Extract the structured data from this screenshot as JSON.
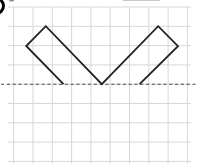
{
  "figure": {
    "canvas": {
      "width": 197,
      "height": 164,
      "background": "#ffffff"
    },
    "grid": {
      "color": "#d7d7d7",
      "stroke_width": 1,
      "spacing": 19.3,
      "vertical": {
        "start_x": 13.7,
        "count": 10,
        "y1": 7,
        "y2": 164
      },
      "horizontal": {
        "start_y": 7,
        "count": 9,
        "x1": 8,
        "x2": 191
      }
    },
    "mirror_line": {
      "y": 84.2,
      "x1": 1,
      "x2": 196,
      "color": "#4d4d4d",
      "stroke_width": 1.1,
      "dash": "3.2,2.6"
    },
    "shape": {
      "type": "open-polyline",
      "color": "#222222",
      "stroke_width": 1.8,
      "points": [
        [
          63.5,
          84.2
        ],
        [
          26.2,
          46.0
        ],
        [
          45.8,
          26.2
        ],
        [
          101.8,
          84.2
        ],
        [
          158.2,
          26.2
        ],
        [
          178.0,
          46.2
        ],
        [
          139.6,
          84.2
        ]
      ]
    },
    "label_badge": {
      "shape": "partial-circle-cut-at-left-edge",
      "cx": -4,
      "cy": 6,
      "r": 7.5,
      "stroke": "#000000",
      "stroke_width": 3,
      "fill": "#ffffff"
    },
    "top_edge_artifacts": [
      {
        "x": 9.3,
        "y": 0,
        "width": 4.5,
        "height": 1.4,
        "color": "#8a8a8a"
      },
      {
        "x": 123,
        "y": 0,
        "width": 37,
        "height": 1.0,
        "color": "#c9c9c9"
      }
    ]
  }
}
